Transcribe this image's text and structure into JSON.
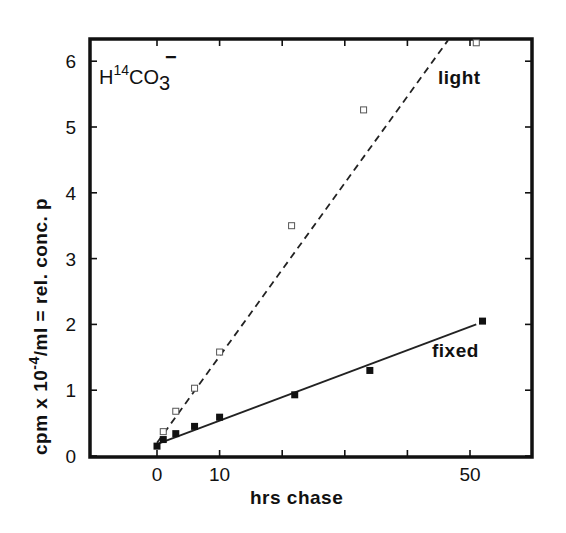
{
  "chart_data": {
    "type": "scatter",
    "title": "",
    "annotation": {
      "base": "H",
      "superscript": "14",
      "formula": "CO",
      "subscript": "3",
      "charge": "−"
    },
    "xlabel": "hrs  chase",
    "ylabel_parts": {
      "pre": "cpm  x  10",
      "exp": "-4",
      "post": "/ml  =  rel. conc. p"
    },
    "xlim": [
      -10.7,
      61
    ],
    "ylim": [
      0,
      6.3
    ],
    "x_ticks": [
      0,
      10,
      20,
      30,
      40,
      50
    ],
    "x_tick_labels": [
      "0",
      "10",
      "",
      "",
      "",
      "50"
    ],
    "y_ticks": [
      0,
      1,
      2,
      3,
      4,
      5,
      6
    ],
    "y_tick_labels": [
      "0",
      "1",
      "2",
      "3",
      "4",
      "5",
      "6"
    ],
    "grid": false,
    "legend": "inline labels",
    "series": [
      {
        "name": "light",
        "marker": "open-square",
        "line_style": "dashed",
        "x": [
          1,
          3,
          6,
          10,
          21.5,
          33,
          51
        ],
        "y": [
          0.37,
          0.68,
          1.03,
          1.58,
          3.5,
          5.26,
          6.28
        ],
        "fit_line": {
          "x": [
            0,
            46.5
          ],
          "y": [
            0.2,
            6.32
          ]
        }
      },
      {
        "name": "fixed",
        "marker": "filled-square",
        "line_style": "solid",
        "x": [
          0,
          1,
          3,
          6,
          10,
          22,
          34,
          52
        ],
        "y": [
          0.15,
          0.25,
          0.34,
          0.45,
          0.59,
          0.93,
          1.3,
          2.05
        ],
        "fit_line": {
          "x": [
            0,
            51
          ],
          "y": [
            0.18,
            2.0
          ]
        }
      }
    ],
    "colors": {
      "axis": "#111111",
      "line": "#222222",
      "background": "#ffffff"
    }
  }
}
